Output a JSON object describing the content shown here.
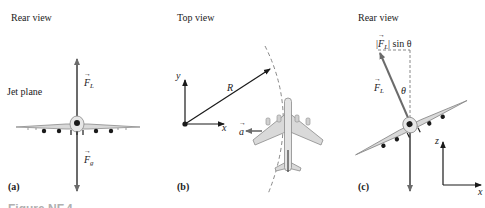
{
  "panels": [
    {
      "id": "a",
      "title": "Rear view",
      "tag": "(a)",
      "side_label": "Jet plane",
      "vectors": [
        {
          "symbol": "F",
          "subscript": "L",
          "direction": "up"
        },
        {
          "symbol": "F",
          "subscript": "g",
          "direction": "down"
        }
      ]
    },
    {
      "id": "b",
      "title": "Top view",
      "tag": "(b)",
      "axes": {
        "x": "x",
        "y": "y"
      },
      "radius_label": "R",
      "accel": {
        "symbol": "a",
        "direction": "left"
      }
    },
    {
      "id": "c",
      "title": "Rear view",
      "tag": "(c)",
      "component_label": {
        "symbol": "F",
        "subscript": "L",
        "suffix": "sin θ"
      },
      "lift": {
        "symbol": "F",
        "subscript": "L"
      },
      "angle": "θ",
      "axes": {
        "x": "x",
        "z": "z"
      }
    }
  ],
  "caption_partial": "Figure NF.4",
  "colors": {
    "arrow": "#6b6b6b",
    "plane_body": "#d9d9d9",
    "plane_outline": "#8a8a8a",
    "dark": "#1a1a1a"
  }
}
